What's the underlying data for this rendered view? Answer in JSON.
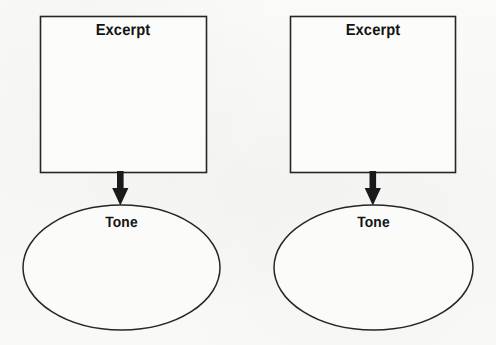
{
  "figure": {
    "background_color": "#f8f8f6",
    "stroke_color": "#262626",
    "text_color": "#141414",
    "groups": [
      {
        "id": "left",
        "box": {
          "label": "Excerpt",
          "shape": "rectangle"
        },
        "connector": {
          "type": "arrow",
          "direction": "down"
        },
        "oval": {
          "label": "Tone",
          "shape": "ellipse"
        }
      },
      {
        "id": "right",
        "box": {
          "label": "Excerpt",
          "shape": "rectangle"
        },
        "connector": {
          "type": "arrow",
          "direction": "down"
        },
        "oval": {
          "label": "Tone",
          "shape": "ellipse"
        }
      }
    ]
  }
}
